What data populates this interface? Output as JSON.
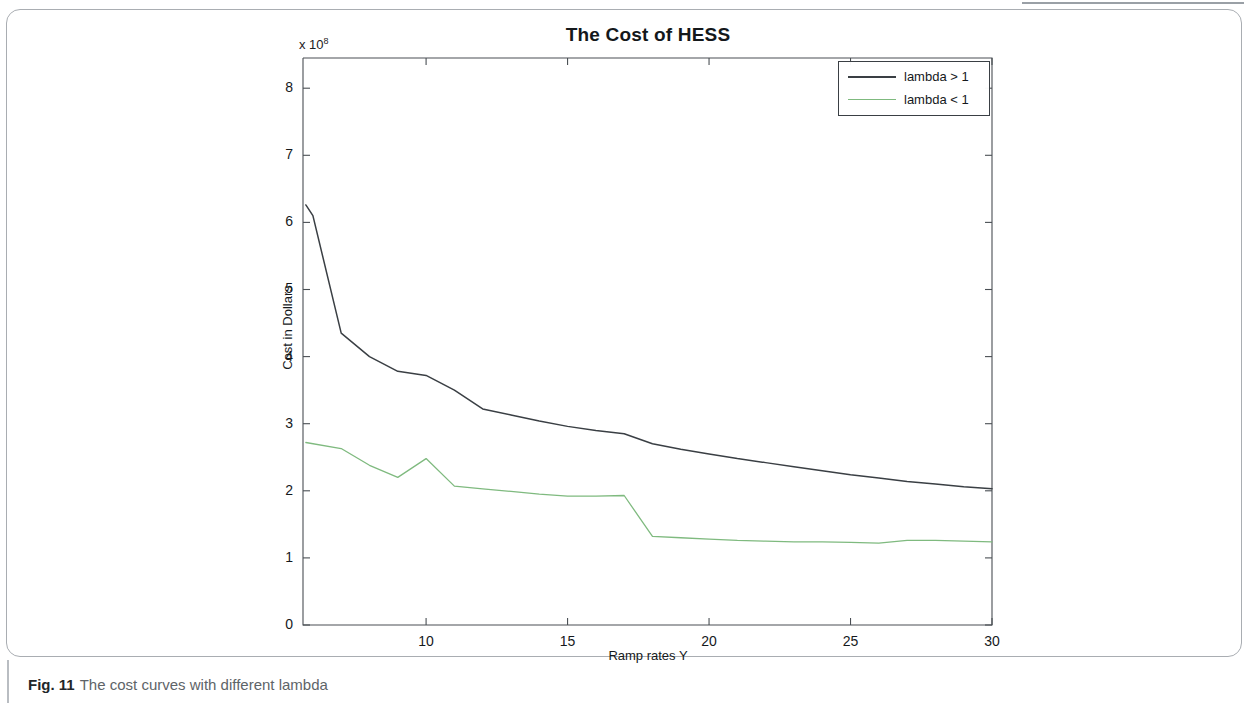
{
  "caption": {
    "label": "Fig. 11",
    "text": "The cost curves with different lambda"
  },
  "chart_data": {
    "type": "line",
    "title": "The Cost of HESS",
    "xlabel": "Ramp rates Y",
    "ylabel": "Cost in Dollars",
    "y_exponent_prefix": "x 10",
    "y_exponent": "8",
    "xlim": [
      5.65,
      30
    ],
    "ylim": [
      0,
      8.45
    ],
    "xticks": [
      10,
      15,
      20,
      25,
      30
    ],
    "xtick_labels": [
      "10",
      "15",
      "20",
      "25",
      "30"
    ],
    "yticks": [
      0,
      1,
      2,
      3,
      4,
      5,
      6,
      7,
      8
    ],
    "ytick_labels": [
      "0",
      "1",
      "2",
      "3",
      "4",
      "5",
      "6",
      "7",
      "8"
    ],
    "grid": false,
    "legend_position": "top-right",
    "series": [
      {
        "name": "lambda > 1",
        "color": "#3a3f44",
        "x": [
          5.75,
          6.0,
          7.0,
          8.0,
          9.0,
          10.0,
          11.0,
          12.0,
          13.0,
          14.0,
          15.0,
          16.0,
          17.0,
          18.0,
          19.0,
          20.0,
          21.0,
          22.0,
          23.0,
          24.0,
          25.0,
          26.0,
          27.0,
          28.0,
          29.0,
          30.0
        ],
        "y": [
          6.26,
          6.1,
          4.35,
          4.0,
          3.78,
          3.72,
          3.5,
          3.22,
          3.13,
          3.04,
          2.96,
          2.9,
          2.85,
          2.7,
          2.62,
          2.55,
          2.48,
          2.42,
          2.36,
          2.3,
          2.24,
          2.19,
          2.14,
          2.1,
          2.06,
          2.03
        ]
      },
      {
        "name": "lambda < 1",
        "color": "#7fba7f",
        "x": [
          5.75,
          7.0,
          8.0,
          9.0,
          10.0,
          11.0,
          12.0,
          13.0,
          14.0,
          15.0,
          16.0,
          17.0,
          18.0,
          19.0,
          20.0,
          21.0,
          22.0,
          23.0,
          24.0,
          25.0,
          26.0,
          27.0,
          28.0,
          29.0,
          30.0
        ],
        "y": [
          2.72,
          2.63,
          2.38,
          2.2,
          2.48,
          2.07,
          2.03,
          1.99,
          1.95,
          1.92,
          1.92,
          1.93,
          1.32,
          1.3,
          1.28,
          1.26,
          1.25,
          1.24,
          1.24,
          1.23,
          1.22,
          1.26,
          1.26,
          1.25,
          1.24
        ]
      }
    ]
  }
}
